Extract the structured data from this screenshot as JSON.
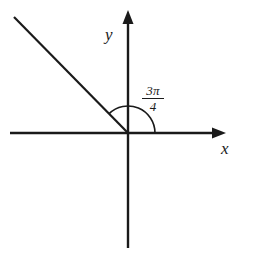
{
  "figure": {
    "background_color": "#ffffff",
    "stroke_color": "#1a1a1a",
    "labels": {
      "y_axis": "y",
      "x_axis": "x",
      "angle_numerator": "3π",
      "angle_denominator": "4",
      "angle_text": "3π/4"
    },
    "geometry": {
      "origin_x": 128,
      "origin_y": 133,
      "x_axis_start_x": 10,
      "x_axis_end_x": 226,
      "y_axis_top_y": 10,
      "y_axis_bottom_y": 248,
      "ray_angle_degrees": 135,
      "ray_end_x": 14,
      "ray_end_y": 16,
      "arc_radius": 27,
      "arrowhead_width": 10,
      "arrowhead_length": 14,
      "line_width": 2
    }
  }
}
